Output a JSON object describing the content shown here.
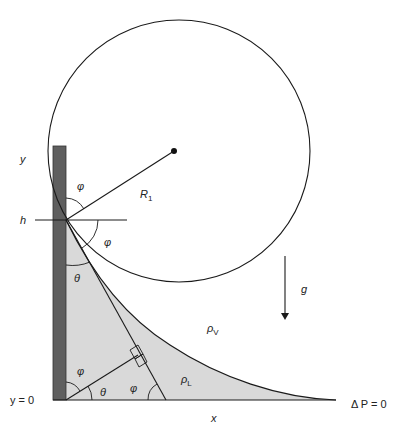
{
  "diagram": {
    "labels": {
      "y": "y",
      "h": "h",
      "y0": "y = 0",
      "x": "x",
      "R1": "R",
      "R1_sub": "1",
      "g": "g",
      "rho_v": "ρ",
      "rho_v_sub": "V",
      "rho_l": "ρ",
      "rho_l_sub": "L",
      "delta_p": "Δ P = 0",
      "phi_top": "φ",
      "phi_right": "φ",
      "theta_upper": "θ",
      "phi_bottom_left": "φ",
      "theta_bottom": "θ",
      "phi_bottom_mid": "φ"
    },
    "colors": {
      "wall": "#5f5f5f",
      "liquid": "#d9d9d9",
      "line": "#1a1a1a"
    }
  }
}
